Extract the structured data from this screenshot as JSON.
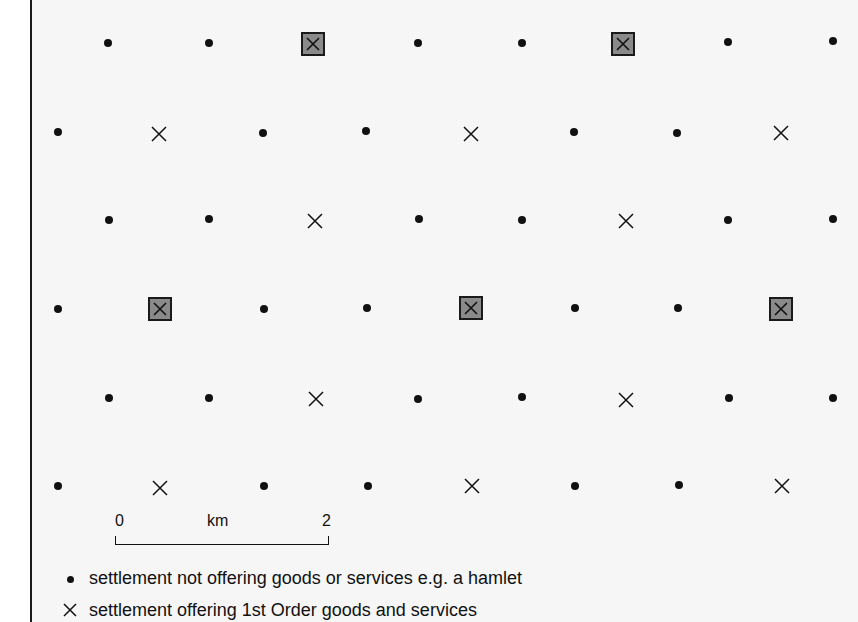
{
  "figure": {
    "colors": {
      "background": "#f6f6f6",
      "symbol": "#111111",
      "box_fill": "#8a8a8a"
    }
  },
  "settlements": [
    {
      "row": 1,
      "x": 108,
      "y": 43,
      "type": "hamlet"
    },
    {
      "row": 1,
      "x": 209,
      "y": 43,
      "type": "hamlet"
    },
    {
      "row": 1,
      "x": 313,
      "y": 44,
      "type": "higher_order"
    },
    {
      "row": 1,
      "x": 418,
      "y": 43,
      "type": "hamlet"
    },
    {
      "row": 1,
      "x": 522,
      "y": 43,
      "type": "hamlet"
    },
    {
      "row": 1,
      "x": 623,
      "y": 44,
      "type": "higher_order"
    },
    {
      "row": 1,
      "x": 728,
      "y": 42,
      "type": "hamlet"
    },
    {
      "row": 1,
      "x": 833,
      "y": 41,
      "type": "hamlet"
    },
    {
      "row": 2,
      "x": 58,
      "y": 132,
      "type": "hamlet"
    },
    {
      "row": 2,
      "x": 159,
      "y": 134,
      "type": "first_order"
    },
    {
      "row": 2,
      "x": 263,
      "y": 133,
      "type": "hamlet"
    },
    {
      "row": 2,
      "x": 366,
      "y": 131,
      "type": "hamlet"
    },
    {
      "row": 2,
      "x": 471,
      "y": 134,
      "type": "first_order"
    },
    {
      "row": 2,
      "x": 574,
      "y": 132,
      "type": "hamlet"
    },
    {
      "row": 2,
      "x": 677,
      "y": 133,
      "type": "hamlet"
    },
    {
      "row": 2,
      "x": 781,
      "y": 133,
      "type": "first_order"
    },
    {
      "row": 3,
      "x": 109,
      "y": 220,
      "type": "hamlet"
    },
    {
      "row": 3,
      "x": 209,
      "y": 219,
      "type": "hamlet"
    },
    {
      "row": 3,
      "x": 315,
      "y": 221,
      "type": "first_order"
    },
    {
      "row": 3,
      "x": 419,
      "y": 219,
      "type": "hamlet"
    },
    {
      "row": 3,
      "x": 522,
      "y": 220,
      "type": "hamlet"
    },
    {
      "row": 3,
      "x": 626,
      "y": 221,
      "type": "first_order"
    },
    {
      "row": 3,
      "x": 728,
      "y": 220,
      "type": "hamlet"
    },
    {
      "row": 3,
      "x": 833,
      "y": 219,
      "type": "hamlet"
    },
    {
      "row": 4,
      "x": 58,
      "y": 309,
      "type": "hamlet"
    },
    {
      "row": 4,
      "x": 160,
      "y": 309,
      "type": "higher_order"
    },
    {
      "row": 4,
      "x": 264,
      "y": 309,
      "type": "hamlet"
    },
    {
      "row": 4,
      "x": 367,
      "y": 308,
      "type": "hamlet"
    },
    {
      "row": 4,
      "x": 471,
      "y": 308,
      "type": "higher_order"
    },
    {
      "row": 4,
      "x": 575,
      "y": 308,
      "type": "hamlet"
    },
    {
      "row": 4,
      "x": 678,
      "y": 308,
      "type": "hamlet"
    },
    {
      "row": 4,
      "x": 781,
      "y": 309,
      "type": "higher_order"
    },
    {
      "row": 5,
      "x": 109,
      "y": 398,
      "type": "hamlet"
    },
    {
      "row": 5,
      "x": 209,
      "y": 398,
      "type": "hamlet"
    },
    {
      "row": 5,
      "x": 316,
      "y": 399,
      "type": "first_order"
    },
    {
      "row": 5,
      "x": 418,
      "y": 399,
      "type": "hamlet"
    },
    {
      "row": 5,
      "x": 522,
      "y": 397,
      "type": "hamlet"
    },
    {
      "row": 5,
      "x": 626,
      "y": 400,
      "type": "first_order"
    },
    {
      "row": 5,
      "x": 729,
      "y": 398,
      "type": "hamlet"
    },
    {
      "row": 5,
      "x": 833,
      "y": 398,
      "type": "hamlet"
    },
    {
      "row": 6,
      "x": 58,
      "y": 486,
      "type": "hamlet"
    },
    {
      "row": 6,
      "x": 160,
      "y": 488,
      "type": "first_order"
    },
    {
      "row": 6,
      "x": 264,
      "y": 486,
      "type": "hamlet"
    },
    {
      "row": 6,
      "x": 368,
      "y": 486,
      "type": "hamlet"
    },
    {
      "row": 6,
      "x": 472,
      "y": 486,
      "type": "first_order"
    },
    {
      "row": 6,
      "x": 575,
      "y": 486,
      "type": "hamlet"
    },
    {
      "row": 6,
      "x": 679,
      "y": 485,
      "type": "hamlet"
    },
    {
      "row": 6,
      "x": 782,
      "y": 486,
      "type": "first_order"
    }
  ],
  "scale_bar": {
    "start_label": "0",
    "unit_label": "km",
    "end_label": "2"
  },
  "legend": {
    "items": [
      {
        "symbol": "dot-icon",
        "label": "settlement not offering goods or services e.g. a hamlet"
      },
      {
        "symbol": "cross-icon",
        "label": "settlement offering 1st Order goods and services"
      }
    ]
  }
}
